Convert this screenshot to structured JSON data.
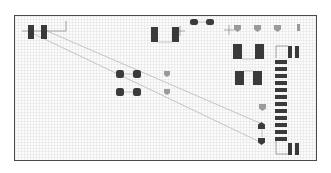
{
  "diagram": {
    "type": "pcb-layout",
    "colors": {
      "pad_dark": "#3a3a3a",
      "pad_mid": "#7a7a7a",
      "pad_light": "#9a9a9a",
      "trace": "#b8b8b8",
      "outline": "#8a8a8a",
      "border": "#4a4a4a"
    },
    "rect_pads": [
      {
        "x": 28,
        "y": 25,
        "w": 6,
        "h": 14,
        "shade": "dark"
      },
      {
        "x": 41,
        "y": 25,
        "w": 6,
        "h": 14,
        "shade": "dark"
      },
      {
        "x": 151,
        "y": 27,
        "w": 7,
        "h": 15,
        "shade": "dark"
      },
      {
        "x": 172,
        "y": 27,
        "w": 7,
        "h": 15,
        "shade": "dark"
      },
      {
        "x": 233,
        "y": 44,
        "w": 9,
        "h": 15,
        "shade": "dark"
      },
      {
        "x": 255,
        "y": 44,
        "w": 9,
        "h": 15,
        "shade": "dark"
      },
      {
        "x": 235,
        "y": 71,
        "w": 9,
        "h": 14,
        "shade": "dark"
      },
      {
        "x": 253,
        "y": 71,
        "w": 9,
        "h": 14,
        "shade": "dark"
      },
      {
        "x": 288,
        "y": 46,
        "w": 4,
        "h": 12,
        "shade": "dark"
      },
      {
        "x": 295,
        "y": 46,
        "w": 4,
        "h": 12,
        "shade": "dark"
      },
      {
        "x": 288,
        "y": 143,
        "w": 4,
        "h": 12,
        "shade": "dark"
      },
      {
        "x": 295,
        "y": 143,
        "w": 4,
        "h": 12,
        "shade": "dark"
      },
      {
        "x": 297,
        "y": 24,
        "w": 3,
        "h": 7,
        "shade": "light"
      }
    ],
    "connector_pads": {
      "x": 275,
      "w": 12,
      "h": 4,
      "ys": [
        60,
        67,
        74,
        81,
        88,
        95,
        102,
        109,
        116,
        123,
        130,
        137
      ]
    },
    "round_pads": [
      {
        "x": 190,
        "y": 19,
        "w": 8,
        "h": 6
      },
      {
        "x": 206,
        "y": 19,
        "w": 8,
        "h": 6
      },
      {
        "x": 116,
        "y": 70,
        "w": 8,
        "h": 8
      },
      {
        "x": 133,
        "y": 70,
        "w": 8,
        "h": 8
      },
      {
        "x": 116,
        "y": 88,
        "w": 8,
        "h": 8
      },
      {
        "x": 133,
        "y": 88,
        "w": 8,
        "h": 8
      }
    ],
    "pentagon_pads": [
      {
        "x": 234,
        "y": 25,
        "s": 7,
        "shade": "light"
      },
      {
        "x": 254,
        "y": 25,
        "s": 7,
        "shade": "light"
      },
      {
        "x": 274,
        "y": 25,
        "s": 7,
        "shade": "light"
      },
      {
        "x": 164,
        "y": 71,
        "s": 6,
        "shade": "light"
      },
      {
        "x": 164,
        "y": 89,
        "s": 6,
        "shade": "light"
      },
      {
        "x": 259,
        "y": 104,
        "s": 7,
        "shade": "light"
      },
      {
        "x": 258,
        "y": 122,
        "s": 7,
        "shade": "dark-up"
      },
      {
        "x": 258,
        "y": 138,
        "s": 7,
        "shade": "dark"
      }
    ],
    "traces": [
      {
        "x1": 47,
        "y1": 31,
        "x2": 262,
        "y2": 124
      },
      {
        "x1": 34,
        "y1": 34,
        "x2": 260,
        "y2": 142
      },
      {
        "x1": 198,
        "y1": 22,
        "x2": 206,
        "y2": 22
      },
      {
        "x1": 124,
        "y1": 74,
        "x2": 133,
        "y2": 74
      },
      {
        "x1": 124,
        "y1": 92,
        "x2": 133,
        "y2": 92
      },
      {
        "x1": 158,
        "y1": 42,
        "x2": 172,
        "y2": 42
      },
      {
        "x1": 242,
        "y1": 59,
        "x2": 255,
        "y2": 59
      },
      {
        "x1": 244,
        "y1": 71,
        "x2": 253,
        "y2": 71
      },
      {
        "x1": 262,
        "y1": 125,
        "x2": 262,
        "y2": 137
      }
    ],
    "outlines": [
      {
        "points": "22,31 66,31 66,21"
      },
      {
        "points": "276,58 276,46 288,46"
      },
      {
        "points": "276,140 276,154 288,154"
      }
    ],
    "crosshairs": [
      {
        "x": 180,
        "y": 31
      },
      {
        "x": 229,
        "y": 30
      }
    ]
  }
}
